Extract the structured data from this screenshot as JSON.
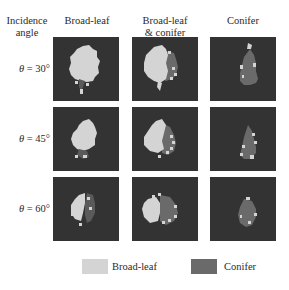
{
  "header": {
    "row_header_line1": "Incidence",
    "row_header_line2": "angle",
    "columns": [
      {
        "line1": "Broad-leaf",
        "line2": ""
      },
      {
        "line1": "Broad-leaf",
        "line2": "& conifer"
      },
      {
        "line1": "Conifer",
        "line2": ""
      }
    ]
  },
  "rows": [
    {
      "symbol": "θ",
      "eq": " = ",
      "value": "30°"
    },
    {
      "symbol": "θ",
      "eq": " = ",
      "value": "45°"
    },
    {
      "symbol": "θ",
      "eq": " = ",
      "value": "60°"
    }
  ],
  "legend": {
    "items": [
      {
        "label": "Broad-leaf",
        "color": "#d4d4d4"
      },
      {
        "label": "Conifer",
        "color": "#6a6a6a"
      }
    ]
  },
  "colors": {
    "background_panel": "#333333",
    "broad_leaf": "#d4d4d4",
    "conifer": "#6a6a6a"
  }
}
